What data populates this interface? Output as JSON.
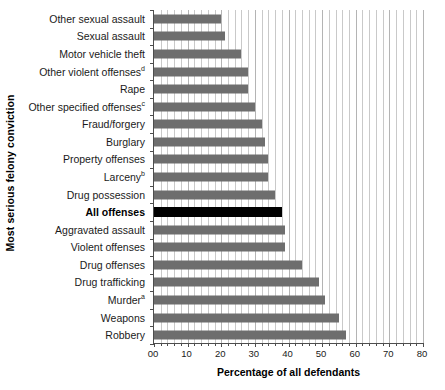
{
  "chart_data": {
    "type": "bar",
    "orientation": "horizontal",
    "title": "",
    "xlabel": "Percentage of all defendants",
    "ylabel": "Most serious felony conviction",
    "xlim": [
      0,
      80
    ],
    "xticks": [
      "00",
      "10",
      "20",
      "30",
      "40",
      "50",
      "60",
      "70",
      "80"
    ],
    "xtick_values": [
      0,
      10,
      20,
      30,
      40,
      50,
      60,
      70,
      80
    ],
    "xtick_minor_step": 2,
    "grid": "vertical",
    "legend": "none",
    "bar_color": "#6e6e6e",
    "highlight_color": "#000000",
    "categories": [
      "Other sexual assault",
      "Sexual assault",
      "Motor vehicle theft",
      "Other violent offenses",
      "Rape",
      "Other specified offenses",
      "Fraud/forgery",
      "Burglary",
      "Property offenses",
      "Larceny",
      "Drug possession",
      "All offenses",
      "Aggravated assault",
      "Violent offenses",
      "Drug offenses",
      "Drug trafficking",
      "Murder",
      "Weapons",
      "Robbery"
    ],
    "category_superscripts": [
      "",
      "",
      "",
      "d",
      "",
      "c",
      "",
      "",
      "",
      "b",
      "",
      "",
      "",
      "",
      "",
      "",
      "a",
      "",
      ""
    ],
    "highlight_index": 11,
    "values": [
      20,
      21,
      26,
      28,
      28,
      30,
      32,
      33,
      34,
      34,
      36,
      38,
      39,
      39,
      44,
      49,
      51,
      55,
      57
    ]
  }
}
